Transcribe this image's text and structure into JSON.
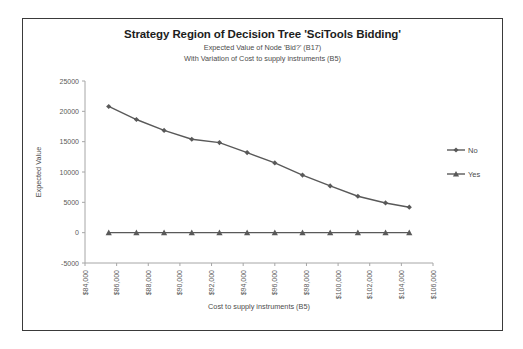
{
  "chart_data": {
    "type": "line",
    "title": "Strategy Region of Decision Tree 'SciTools Bidding'",
    "subtitle1": "Expected Value of Node 'Bid?' (B17)",
    "subtitle2": "With Variation of Cost to supply instruments (B5)",
    "xlabel": "Cost to supply instruments (B5)",
    "ylabel": "Expected Value",
    "xlim": [
      84000,
      106000
    ],
    "ylim": [
      -5000,
      25000
    ],
    "xticks": [
      "$84,000",
      "$86,000",
      "$88,000",
      "$90,000",
      "$92,000",
      "$94,000",
      "$96,000",
      "$98,000",
      "$100,000",
      "$102,000",
      "$104,000",
      "$106,000"
    ],
    "xtick_values": [
      84000,
      86000,
      88000,
      90000,
      92000,
      94000,
      96000,
      98000,
      100000,
      102000,
      104000,
      106000
    ],
    "yticks": [
      "-5000",
      "0",
      "5000",
      "10000",
      "15000",
      "20000",
      "25000"
    ],
    "ytick_values": [
      -5000,
      0,
      5000,
      10000,
      15000,
      20000,
      25000
    ],
    "grid": false,
    "legend_position": "right",
    "x": [
      85500,
      87250,
      89000,
      90750,
      92500,
      94250,
      96000,
      97750,
      99500,
      101250,
      103000,
      104500
    ],
    "series": [
      {
        "name": "No",
        "marker": "diamond",
        "color": "#595959",
        "values": [
          20800,
          18650,
          16850,
          15400,
          14850,
          13200,
          11500,
          9500,
          7700,
          6000,
          4900,
          4200
        ]
      },
      {
        "name": "Yes",
        "marker": "triangle",
        "color": "#595959",
        "values": [
          0,
          0,
          0,
          0,
          0,
          0,
          0,
          0,
          0,
          0,
          0,
          0
        ]
      }
    ]
  },
  "legend": {
    "entries": [
      {
        "label": "No"
      },
      {
        "label": "Yes"
      }
    ]
  }
}
